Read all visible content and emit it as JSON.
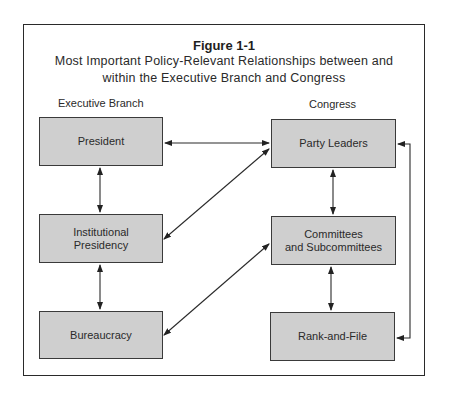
{
  "figure": {
    "title": "Figure 1-1",
    "subtitle_line1": "Most Important Policy-Relevant Relationships between and",
    "subtitle_line2": "within the Executive Branch and Congress"
  },
  "columns": {
    "left_label": "Executive Branch",
    "right_label": "Congress"
  },
  "nodes": {
    "president": "President",
    "institutional_presidency_line1": "Institutional",
    "institutional_presidency_line2": "Presidency",
    "bureaucracy": "Bureaucracy",
    "party_leaders": "Party Leaders",
    "committees_line1": "Committees",
    "committees_line2": "and Subcommittees",
    "rank_and_file": "Rank-and-File"
  },
  "edges": [
    {
      "from": "President",
      "to": "Party Leaders",
      "type": "bidirectional"
    },
    {
      "from": "President",
      "to": "Institutional Presidency",
      "type": "bidirectional"
    },
    {
      "from": "Institutional Presidency",
      "to": "Bureaucracy",
      "type": "bidirectional"
    },
    {
      "from": "Institutional Presidency",
      "to": "Party Leaders",
      "type": "bidirectional"
    },
    {
      "from": "Bureaucracy",
      "to": "Committees and Subcommittees",
      "type": "bidirectional"
    },
    {
      "from": "Party Leaders",
      "to": "Committees and Subcommittees",
      "type": "bidirectional"
    },
    {
      "from": "Committees and Subcommittees",
      "to": "Rank-and-File",
      "type": "bidirectional"
    },
    {
      "from": "Party Leaders",
      "to": "Rank-and-File",
      "type": "bidirectional"
    }
  ]
}
